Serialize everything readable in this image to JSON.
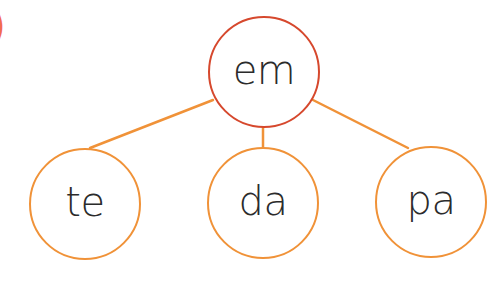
{
  "fragment": {
    "glyph": ")",
    "color": "#f26b4f"
  },
  "diagram": {
    "type": "tree",
    "root": {
      "label": "em",
      "cx": 264,
      "cy": 72,
      "r": 56,
      "stroke": "#d6482d"
    },
    "children": [
      {
        "label": "te",
        "cx": 85,
        "cy": 204,
        "r": 56,
        "stroke": "#f09238"
      },
      {
        "label": "da",
        "cx": 263,
        "cy": 203,
        "r": 56,
        "stroke": "#f09238"
      },
      {
        "label": "pa",
        "cx": 431,
        "cy": 202,
        "r": 56,
        "stroke": "#f09238"
      }
    ],
    "edges": [
      {
        "from": "em",
        "to": "te",
        "x1": 213,
        "y1": 100,
        "x2": 90,
        "y2": 148
      },
      {
        "from": "em",
        "to": "da",
        "x1": 263,
        "y1": 128,
        "x2": 263,
        "y2": 147
      },
      {
        "from": "em",
        "to": "pa",
        "x1": 313,
        "y1": 100,
        "x2": 408,
        "y2": 148
      }
    ],
    "edge_color": "#f09238",
    "text_color": "#2b2b2b"
  }
}
